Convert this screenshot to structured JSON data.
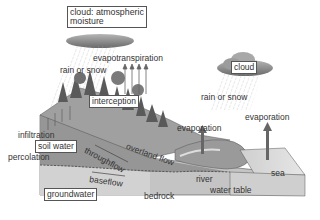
{
  "diagram": {
    "boxed_labels": {
      "cloud_atmospheric": "cloud: atmospheric moisture",
      "cloud_atmospheric_line1": "cloud: atmospheric",
      "cloud_atmospheric_line2": "moisture",
      "cloud": "cloud",
      "interception": "interception",
      "soil_water": "soil water",
      "groundwater": "groundwater"
    },
    "labels": {
      "evapotranspiration": "evapotranspiration",
      "rain_or_snow_left": "rain or snow",
      "rain_or_snow_right": "rain or snow",
      "evaporation_river": "evaporation",
      "evaporation_sea": "evaporation",
      "infiltration": "infiltration",
      "percolation": "percolation",
      "throughflow": "throughflow",
      "overland_flow": "overland flow",
      "baseflow": "baseflow",
      "bedrock": "bedrock",
      "river": "river",
      "water_table": "water table",
      "sea": "sea"
    },
    "colors": {
      "cloud": "#8a8a8a",
      "land_top": "#a9a9a9",
      "soil": "#8c8c8c",
      "groundwater": "#c8c8c8",
      "bedrock": "#bdbdbd",
      "sea": "#dcdcdc",
      "arrow": "#6e6e6e"
    }
  }
}
